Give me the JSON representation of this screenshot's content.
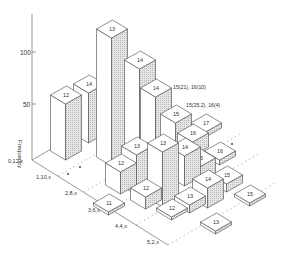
{
  "chart_data": {
    "type": "bar3d",
    "title": "",
    "ylabel": "Frequency",
    "yticks": [
      50,
      100
    ],
    "row_labels": [
      "0,12,x",
      "1,10,x",
      "2,8,x",
      "3,6,x",
      "4,4,x",
      "5,2,x"
    ],
    "annotations": [
      "15(21), 16(10)",
      "15(35.2), 16(4)"
    ],
    "bars": [
      {
        "label": "14",
        "x": 89,
        "y": 84,
        "h": 50,
        "row": 0
      },
      {
        "label": "13",
        "x": 112,
        "y": 29,
        "h": 128,
        "row": 0
      },
      {
        "label": "14",
        "x": 140,
        "y": 60,
        "h": 90,
        "row": 0
      },
      {
        "label": "14",
        "x": 156,
        "y": 88,
        "h": 62,
        "row": 0
      },
      {
        "label": "17",
        "x": 206,
        "y": 123,
        "h": 5,
        "row": 0
      },
      {
        "label": "15",
        "x": 176,
        "y": 114,
        "h": 35,
        "row": 0
      },
      {
        "label": "16",
        "x": 193,
        "y": 133,
        "h": 14,
        "row": 0
      },
      {
        "label": "12",
        "x": 66,
        "y": 95,
        "h": 56,
        "row": 0
      },
      {
        "label": "16",
        "x": 220,
        "y": 151,
        "h": 5,
        "row": 1
      },
      {
        "label": "15",
        "x": 200,
        "y": 158,
        "h": 18,
        "row": 1
      },
      {
        "label": "14",
        "x": 185,
        "y": 147,
        "h": 30,
        "row": 1
      },
      {
        "label": "13",
        "x": 137,
        "y": 146,
        "h": 40,
        "row": 1
      },
      {
        "label": "13",
        "x": 163,
        "y": 143,
        "h": 55,
        "row": 1
      },
      {
        "label": "12",
        "x": 121,
        "y": 163,
        "h": 22,
        "row": 1
      },
      {
        "label": "15",
        "x": 227,
        "y": 175,
        "h": 8,
        "row": 2
      },
      {
        "label": "14",
        "x": 208,
        "y": 179,
        "h": 20,
        "row": 2
      },
      {
        "label": "12",
        "x": 146,
        "y": 188,
        "h": 12,
        "row": 2
      },
      {
        "label": "13",
        "x": 190,
        "y": 196,
        "h": 8,
        "row": 3
      },
      {
        "label": "11",
        "x": 109,
        "y": 203,
        "h": 3,
        "row": 3
      },
      {
        "label": "15",
        "x": 250,
        "y": 194,
        "h": 3,
        "row": 4
      },
      {
        "label": "12",
        "x": 172,
        "y": 208,
        "h": 3,
        "row": 4
      },
      {
        "label": "13",
        "x": 216,
        "y": 222,
        "h": 3,
        "row": 5
      }
    ]
  },
  "axis": {
    "ylabel": "Frequency",
    "tick_100": "100",
    "tick_50": "50"
  },
  "rows": [
    "0,12,x",
    "1,10,x",
    "2,8,x",
    "3,6,x",
    "4,4,x",
    "5,2,x"
  ],
  "annotations": {
    "a1": "15(21), 16(10)",
    "a2": "15(35.2), 16(4)"
  }
}
